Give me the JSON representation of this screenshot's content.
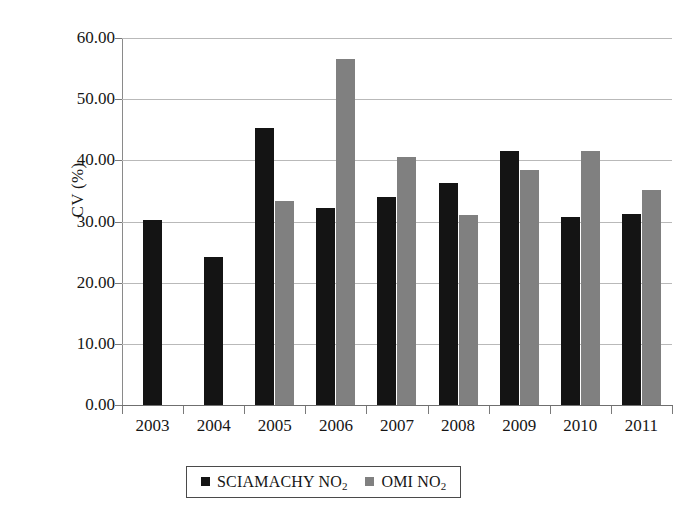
{
  "chart_data": {
    "type": "bar",
    "title": "",
    "xlabel": "",
    "ylabel": "CV (%)",
    "categories": [
      "2003",
      "2004",
      "2005",
      "2006",
      "2007",
      "2008",
      "2009",
      "2010",
      "2011"
    ],
    "series": [
      {
        "name": "SCIAMACHY NO2",
        "color": "#141414",
        "values": [
          30.3,
          24.2,
          45.3,
          32.2,
          34.0,
          36.3,
          41.5,
          30.8,
          31.2
        ]
      },
      {
        "name": "OMI NO2",
        "color": "#808080",
        "values": [
          null,
          null,
          33.4,
          56.5,
          40.6,
          31.0,
          38.4,
          41.5,
          35.1
        ]
      }
    ],
    "ylim": [
      0,
      60
    ],
    "ytick_values": [
      0,
      10,
      20,
      30,
      40,
      50,
      60
    ],
    "ytick_labels": [
      "0.00",
      "10.00",
      "20.00",
      "30.00",
      "40.00",
      "50.00",
      "60.00"
    ],
    "grid": true,
    "legend_position": "bottom"
  },
  "axis": {
    "y_title_main": "CV (%)"
  },
  "legend": {
    "entries": [
      {
        "label_main": "SCIAMACHY NO",
        "label_sub": "2",
        "swatch": "s1"
      },
      {
        "label_main": "OMI NO",
        "label_sub": "2",
        "swatch": "s2"
      }
    ]
  }
}
